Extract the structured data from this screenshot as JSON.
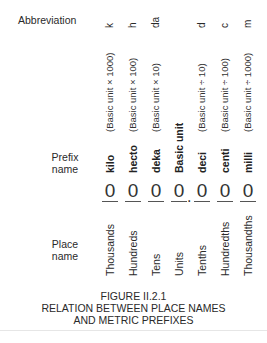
{
  "row_labels": {
    "abbreviation": "Abbreviation",
    "prefix_line1": "Prefix",
    "prefix_line2": "name",
    "place_line1": "Place",
    "place_line2": "name"
  },
  "columns": [
    {
      "abbr": "k",
      "definition": "(Basic unit × 1000)",
      "prefix": "kilo",
      "digit": "0",
      "place": "Thousands"
    },
    {
      "abbr": "h",
      "definition": "(Basic unit × 100)",
      "prefix": "hecto",
      "digit": "0",
      "place": "Hundreds"
    },
    {
      "abbr": "da",
      "definition": "(Basic unit × 10)",
      "prefix": "deka",
      "digit": "0",
      "place": "Tens"
    },
    {
      "abbr": "",
      "definition": "",
      "prefix": "Basic unit",
      "digit": "0",
      "place": "Units"
    },
    {
      "abbr": "d",
      "definition": "(Basic unit ÷ 10)",
      "prefix": "deci",
      "digit": "0",
      "place": "Tenths"
    },
    {
      "abbr": "c",
      "definition": "(Basic unit ÷ 100)",
      "prefix": "centi",
      "digit": "0",
      "place": "Hundredths"
    },
    {
      "abbr": "m",
      "definition": "(Basic unit ÷ 1000)",
      "prefix": "milli",
      "digit": "0",
      "place": "Thousandths"
    }
  ],
  "decimal_point": ".",
  "caption": {
    "figure": "FIGURE II.2.1",
    "line1": "RELATION BETWEEN PLACE NAMES",
    "line2": "AND METRIC PREFIXES"
  }
}
